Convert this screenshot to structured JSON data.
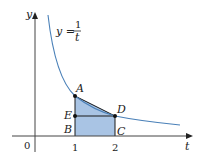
{
  "figure": {
    "axes": {
      "x_label": "t",
      "y_label": "y",
      "origin_label": "0",
      "x_ticks": [
        "1",
        "2"
      ]
    },
    "curve": {
      "equation_lhs": "y =",
      "equation_num": "1",
      "equation_den": "t",
      "color": "#4a80b8"
    },
    "points": {
      "A": "A",
      "B": "B",
      "C": "C",
      "D": "D",
      "E": "E"
    },
    "region": {
      "fill_color": "#a9c4e4",
      "description": "area under y=1/t from t=1 to t=2"
    }
  }
}
